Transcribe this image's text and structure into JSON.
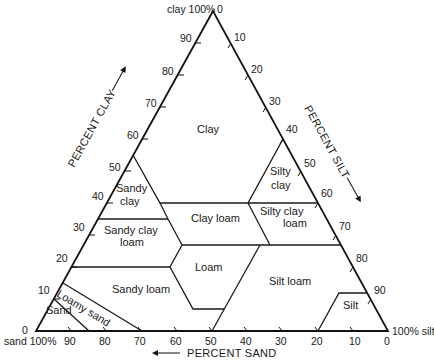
{
  "diagram": {
    "vertices": {
      "top": "clay 100%",
      "bottom_left": "sand 100%",
      "bottom_right": "100% silt"
    },
    "axes": {
      "clay": {
        "label": "PERCENT CLAY",
        "ticks": [
          "90",
          "80",
          "70",
          "60",
          "50",
          "40",
          "30",
          "20",
          "10",
          "0"
        ]
      },
      "silt": {
        "label": "PERCENT SILT",
        "ticks": [
          "0",
          "10",
          "20",
          "30",
          "40",
          "50",
          "60",
          "70",
          "80",
          "90"
        ]
      },
      "sand": {
        "label": "PERCENT SAND",
        "ticks": [
          "90",
          "80",
          "70",
          "60",
          "50",
          "40",
          "30",
          "20",
          "10",
          "0"
        ]
      }
    },
    "top_zero": "0",
    "regions": {
      "clay": "Clay",
      "sandy_clay_1": "Sandy",
      "sandy_clay_2": "clay",
      "silty_clay_1": "Silty",
      "silty_clay_2": "clay",
      "sandy_clay_loam_1": "Sandy clay",
      "sandy_clay_loam_2": "loam",
      "clay_loam": "Clay loam",
      "silty_clay_loam_1": "Silty clay",
      "silty_clay_loam_2": "loam",
      "loam": "Loam",
      "sandy_loam": "Sandy loam",
      "silt_loam": "Silt loam",
      "silt": "Silt",
      "loamy_sand": "Loamy sand",
      "sand": "Sand"
    },
    "colors": {
      "line": "#1a1a1a",
      "background": "#ffffff"
    }
  }
}
